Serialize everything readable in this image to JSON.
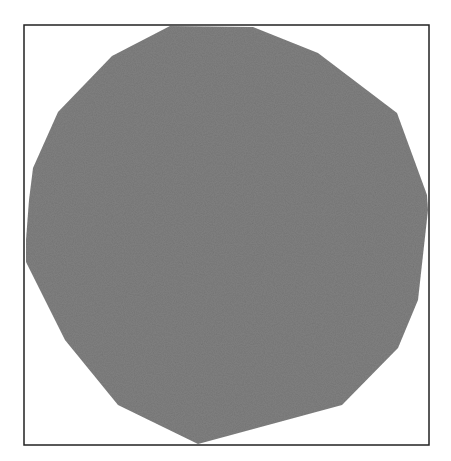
{
  "figure": {
    "frame": {
      "x": 24,
      "y": 25,
      "width": 405,
      "height": 420,
      "stroke": "#222222"
    },
    "shape": {
      "kind": "irregular-polygon",
      "fill": "#808080",
      "points": "170,26 253,27 318,53 397,113 427,195 428,210 418,300 398,348 342,405 198,444 118,405 65,340 26,262 26,240 29,200 33,168 58,112 112,56"
    }
  }
}
